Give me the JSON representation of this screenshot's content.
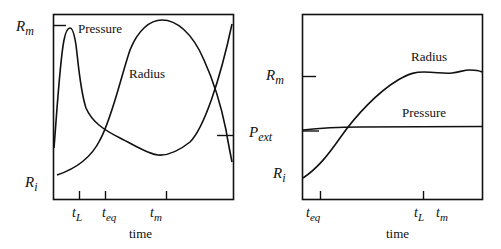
{
  "panels": [
    {
      "id": "left",
      "y_labels": {
        "top": "R",
        "top_sub": "m",
        "bottom": "R",
        "bottom_sub": "i"
      },
      "curve_labels": {
        "pressure": "Pressure",
        "radius": "Radius"
      },
      "x_ticks": [
        {
          "main": "t",
          "sub": "L"
        },
        {
          "main": "t",
          "sub": "eq"
        },
        {
          "main": "t",
          "sub": "m"
        }
      ],
      "x_label": "time"
    },
    {
      "id": "right",
      "y_labels": {
        "top": "R",
        "top_sub": "m",
        "mid": "P",
        "mid_sub": "ext",
        "bottom": "R",
        "bottom_sub": "i"
      },
      "curve_labels": {
        "pressure": "Pressure",
        "radius": "Radius"
      },
      "x_ticks": [
        {
          "main": "t",
          "sub": "eq"
        },
        {
          "main": "t",
          "sub": "L"
        },
        {
          "main": "t",
          "sub": "m"
        }
      ],
      "x_label": "time"
    }
  ],
  "colors": {
    "line": "#111111",
    "background": "#ffffff"
  }
}
